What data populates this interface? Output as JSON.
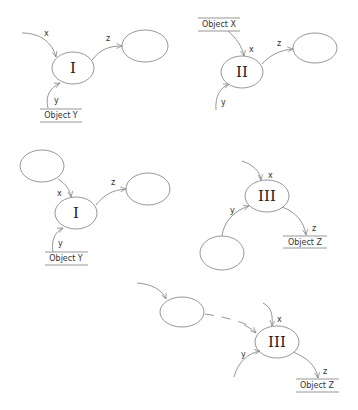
{
  "diagram": {
    "panels": [
      {
        "id": "panel-1",
        "process": {
          "label": "I",
          "cx": 73,
          "cy": 68
        },
        "inputs": [
          {
            "label": "x",
            "source": "external"
          },
          {
            "label": "y",
            "source": "Object Y"
          }
        ],
        "outputs": [
          {
            "label": "z",
            "target": "empty node"
          }
        ],
        "object": "Object Y"
      },
      {
        "id": "panel-2",
        "process": {
          "label": "II",
          "cx": 242,
          "cy": 72
        },
        "inputs": [
          {
            "label": "x",
            "source": "Object X"
          },
          {
            "label": "y",
            "source": "external"
          }
        ],
        "outputs": [
          {
            "label": "z",
            "target": "empty node"
          }
        ],
        "object": "Object X"
      },
      {
        "id": "panel-3",
        "process": {
          "label": "I",
          "cx": 76,
          "cy": 213
        },
        "inputs": [
          {
            "label": "x",
            "source": "empty node"
          },
          {
            "label": "y",
            "source": "Object Y"
          }
        ],
        "outputs": [
          {
            "label": "z",
            "target": "empty node"
          }
        ],
        "object": "Object Y"
      },
      {
        "id": "panel-4",
        "process": {
          "label": "III",
          "cx": 267,
          "cy": 196
        },
        "inputs": [
          {
            "label": "x",
            "source": "external"
          },
          {
            "label": "y",
            "source": "empty node"
          }
        ],
        "outputs": [
          {
            "label": "z",
            "target": "Object Z"
          }
        ],
        "object": "Object Z"
      },
      {
        "id": "panel-5",
        "process": {
          "label": "III",
          "cx": 277,
          "cy": 342
        },
        "inputs": [
          {
            "label": "x",
            "source": "external"
          },
          {
            "label": "y",
            "source": "external"
          },
          {
            "label": "",
            "source": "empty node (dashed)"
          }
        ],
        "outputs": [
          {
            "label": "z",
            "target": "Object Z"
          }
        ],
        "object": "Object Z"
      }
    ],
    "labels": {
      "x": "x",
      "y": "y",
      "z": "z",
      "num_I": "I",
      "num_II": "II",
      "num_III": "III",
      "object_x": "Object X",
      "object_y": "Object Y",
      "object_z": "Object Z"
    },
    "colors": {
      "stroke": "#8a8a8a",
      "text": "#222222",
      "background": "#ffffff"
    }
  }
}
